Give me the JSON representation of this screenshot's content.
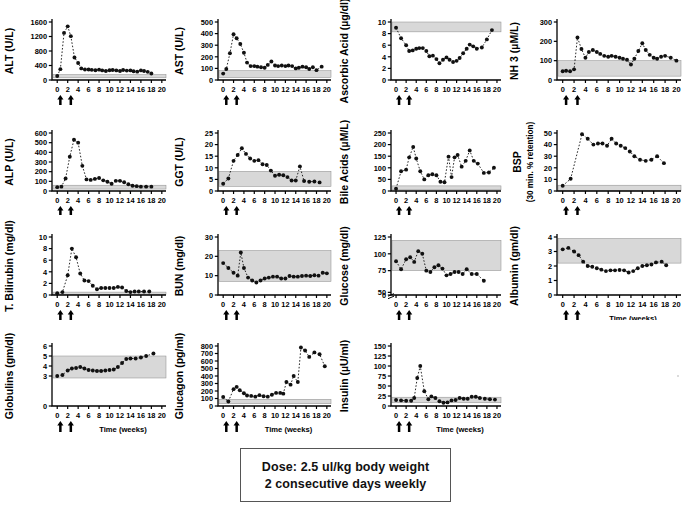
{
  "figure": {
    "xlabel": "Time  (weeks)",
    "xticks": [
      0,
      2,
      4,
      6,
      8,
      10,
      12,
      14,
      16,
      18,
      20
    ],
    "xlim": [
      -1,
      20.8
    ],
    "dose_arrows_weeks": [
      0.6,
      2.6
    ],
    "arrow_marker": "up-arrow",
    "band_color": "#d8d8d8",
    "line_color": "#111111",
    "marker": "filled-circle"
  },
  "caption": {
    "line1": "Dose: 2.5 ul/kg body weight",
    "line2": "2 consecutive days weekly"
  },
  "chart_data": [
    {
      "id": "alt",
      "type": "line",
      "ylabel": "ALT (U/L)",
      "ylim": [
        0,
        1600
      ],
      "yticks": [
        0,
        400,
        800,
        1200,
        1600
      ],
      "ref_band": [
        60,
        150
      ],
      "xlabel": "",
      "show_xlabel": false,
      "x": [
        0,
        0.6,
        1.3,
        2,
        2.6,
        3.3,
        4,
        4.6,
        5.3,
        6,
        6.6,
        7.3,
        8,
        8.6,
        9.3,
        10,
        10.6,
        11.3,
        12,
        12.6,
        13.3,
        14,
        14.6,
        15.3,
        16,
        16.6,
        17.3,
        18
      ],
      "values": [
        110,
        300,
        1300,
        1480,
        1210,
        620,
        470,
        320,
        290,
        290,
        280,
        270,
        285,
        265,
        250,
        270,
        275,
        265,
        250,
        275,
        260,
        265,
        240,
        230,
        265,
        250,
        225,
        180
      ]
    },
    {
      "id": "ast",
      "type": "line",
      "ylabel": "AST (U/L)",
      "ylim": [
        0,
        500
      ],
      "yticks": [
        0,
        100,
        200,
        300,
        400,
        500
      ],
      "ref_band": [
        20,
        80
      ],
      "xlabel": "",
      "show_xlabel": false,
      "x": [
        0,
        0.6,
        1.3,
        2,
        2.6,
        3.3,
        4,
        4.6,
        5.3,
        6,
        6.6,
        7.3,
        8,
        8.6,
        9.3,
        10,
        10.6,
        11.3,
        12,
        12.6,
        13.3,
        14,
        14.6,
        15.3,
        16,
        16.6,
        17.3,
        18,
        19
      ],
      "values": [
        55,
        95,
        230,
        395,
        360,
        310,
        235,
        150,
        120,
        120,
        115,
        110,
        105,
        130,
        160,
        125,
        120,
        125,
        120,
        125,
        120,
        100,
        105,
        115,
        110,
        95,
        110,
        85,
        115
      ]
    },
    {
      "id": "ascorbic-acid",
      "type": "line",
      "ylabel": "Ascorbic  Acid (µg/dl)",
      "ylim": [
        0,
        10
      ],
      "yticks": [
        0,
        2,
        4,
        6,
        8,
        10
      ],
      "ref_band": [
        8.3,
        10
      ],
      "xlabel": "",
      "show_xlabel": false,
      "x": [
        0,
        1,
        2,
        2.6,
        3.3,
        4,
        4.6,
        5.3,
        6,
        6.6,
        7.3,
        8,
        8.6,
        9.3,
        10,
        10.6,
        11.3,
        12,
        12.6,
        13.3,
        14,
        14.6,
        15.3,
        16,
        17,
        18,
        19
      ],
      "values": [
        9.0,
        7.2,
        6.0,
        5.0,
        5.1,
        5.4,
        5.5,
        5.5,
        5.0,
        4.1,
        4.2,
        3.6,
        2.9,
        3.5,
        3.9,
        3.5,
        3.1,
        3.3,
        3.8,
        4.6,
        5.4,
        6.1,
        5.8,
        5.4,
        5.6,
        7.0,
        8.6
      ]
    },
    {
      "id": "nh3",
      "type": "line",
      "ylabel": "NH 3  (µM/L)",
      "ylim": [
        0,
        300
      ],
      "yticks": [
        0,
        100,
        200,
        300
      ],
      "ref_band": [
        20,
        100
      ],
      "xlabel": "",
      "show_xlabel": false,
      "x": [
        0,
        0.6,
        1.3,
        2,
        2.6,
        3.3,
        4,
        4.6,
        5.3,
        6,
        6.6,
        7.3,
        8,
        8.6,
        9.3,
        10,
        10.6,
        11.3,
        12,
        12.6,
        13.3,
        14,
        14.6,
        15.3,
        16,
        16.6,
        17.3,
        18,
        19,
        20
      ],
      "values": [
        45,
        48,
        45,
        55,
        220,
        160,
        115,
        145,
        155,
        145,
        135,
        125,
        120,
        125,
        120,
        115,
        110,
        105,
        80,
        110,
        150,
        190,
        155,
        130,
        115,
        110,
        120,
        125,
        115,
        100
      ]
    },
    {
      "id": "alp",
      "type": "line",
      "ylabel": "ALP (U/L)",
      "ylim": [
        0,
        600
      ],
      "yticks": [
        0,
        100,
        200,
        300,
        400,
        500,
        600
      ],
      "ref_band": [
        20,
        60
      ],
      "xlabel": "",
      "show_xlabel": false,
      "x": [
        0,
        0.8,
        1.6,
        2.4,
        3.2,
        4,
        4.8,
        5.6,
        6.4,
        7.2,
        8,
        8.8,
        9.6,
        10.4,
        11.2,
        12,
        12.8,
        13.6,
        14.4,
        15.2,
        16,
        17,
        18
      ],
      "values": [
        40,
        45,
        130,
        355,
        530,
        500,
        260,
        120,
        115,
        125,
        135,
        110,
        95,
        75,
        105,
        105,
        90,
        70,
        55,
        50,
        45,
        45,
        45
      ]
    },
    {
      "id": "ggt",
      "type": "line",
      "ylabel": "GGT (U/L)",
      "ylim": [
        0,
        25
      ],
      "yticks": [
        0,
        5,
        10,
        15,
        20,
        25
      ],
      "ref_band": [
        2,
        8.5
      ],
      "xlabel": "",
      "show_xlabel": false,
      "x": [
        0,
        1,
        2,
        2.8,
        3.6,
        4.4,
        5.2,
        6,
        6.8,
        7.6,
        8.4,
        9.2,
        10,
        10.8,
        11.6,
        12.4,
        13.2,
        14,
        14.8,
        15.6,
        16.6,
        17.6,
        18.6
      ],
      "values": [
        3.1,
        5.4,
        13.0,
        15.5,
        18.4,
        16.0,
        14.0,
        13.0,
        13.3,
        11.5,
        11.2,
        8.8,
        6.6,
        7.0,
        6.8,
        6.0,
        4.5,
        4.5,
        10.6,
        4.3,
        4.0,
        4.1,
        3.7
      ]
    },
    {
      "id": "bile-acids",
      "type": "line",
      "ylabel": "Bile Acids (µM/L)",
      "ylim": [
        0,
        250
      ],
      "yticks": [
        0,
        50,
        100,
        150,
        200,
        250
      ],
      "ref_band": [
        5,
        22
      ],
      "xlabel": "",
      "show_xlabel": false,
      "x": [
        0,
        1,
        2,
        2.6,
        3.4,
        4,
        4.8,
        5.6,
        6.4,
        7.2,
        8,
        8.8,
        9.6,
        10.4,
        11,
        11.6,
        12.2,
        13,
        13.8,
        14.6,
        15.4,
        16.2,
        17.4,
        18.4,
        19.4
      ],
      "values": [
        10,
        85,
        92,
        145,
        190,
        140,
        85,
        50,
        68,
        72,
        68,
        40,
        38,
        148,
        60,
        145,
        155,
        105,
        130,
        175,
        130,
        118,
        78,
        80,
        100
      ]
    },
    {
      "id": "bsp",
      "type": "line",
      "ylabel": "BSP",
      "ylabel2": "(30 min. % retention)",
      "ylim": [
        0,
        50
      ],
      "yticks": [
        0,
        10,
        20,
        30,
        40,
        50
      ],
      "ref_band": [
        0,
        5
      ],
      "xlabel": "",
      "show_xlabel": false,
      "x": [
        0,
        1.4,
        3.4,
        4.4,
        5.4,
        6.2,
        7,
        7.8,
        8.6,
        9.4,
        10.2,
        11,
        11.8,
        12.6,
        13.6,
        14.6,
        15.6,
        16.6,
        17.8
      ],
      "values": [
        4.5,
        10.5,
        49,
        45,
        40,
        41,
        41,
        39,
        45,
        41,
        39,
        37,
        34,
        30,
        27,
        26,
        27,
        30,
        24
      ]
    },
    {
      "id": "t-bilirubin",
      "type": "line",
      "ylabel": "T. Bilirubin (mg/dl)",
      "ylim": [
        0,
        10
      ],
      "yticks": [
        0,
        2,
        4,
        6,
        8,
        10
      ],
      "ref_band": [
        0.05,
        0.5
      ],
      "xlabel": "",
      "show_xlabel": false,
      "x": [
        0,
        1,
        2,
        2.8,
        3.6,
        4.4,
        5.2,
        6,
        6.8,
        7.6,
        8.4,
        9.2,
        10,
        10.8,
        11.6,
        12.4,
        13.2,
        14,
        14.8,
        15.6,
        16.6,
        17.6
      ],
      "values": [
        0.3,
        0.5,
        3.4,
        8.0,
        6.5,
        3.7,
        2.5,
        2.4,
        1.6,
        1.0,
        1.2,
        1.2,
        1.2,
        1.2,
        1.4,
        1.3,
        0.7,
        0.5,
        0.6,
        0.6,
        0.6,
        0.6
      ]
    },
    {
      "id": "bun",
      "type": "line",
      "ylabel": "BUN (mg/dl)",
      "ylim": [
        0,
        30
      ],
      "yticks": [
        0,
        10,
        20,
        30
      ],
      "ref_band": [
        7,
        23
      ],
      "xlabel": "",
      "show_xlabel": false,
      "x": [
        0,
        1,
        2,
        2.8,
        3.4,
        4,
        4.8,
        5.6,
        6.4,
        7.2,
        8,
        8.8,
        9.6,
        10.4,
        11.2,
        12,
        12.8,
        13.6,
        14.4,
        15.2,
        16,
        16.8,
        17.6,
        18.4,
        19.2,
        20
      ],
      "values": [
        16.5,
        14,
        11.5,
        10,
        22,
        14,
        9,
        7.5,
        6.5,
        7.5,
        8.5,
        9,
        9.5,
        9.5,
        8.5,
        8.5,
        9.8,
        9.5,
        9.5,
        9.8,
        10,
        9.8,
        10.2,
        10,
        11.5,
        11.2
      ]
    },
    {
      "id": "glucose",
      "type": "line",
      "ylabel": "Glucose (mg/dl)",
      "ylim": [
        0,
        125
      ],
      "yticks": [
        0,
        50,
        75,
        100,
        125
      ],
      "axis_break_after": 0,
      "ref_band": [
        75,
        120
      ],
      "xlabel": "",
      "show_xlabel": false,
      "x": [
        0,
        1,
        2,
        2.8,
        3.6,
        4.4,
        5.2,
        6,
        6.8,
        7.6,
        8.4,
        9.2,
        10,
        10.8,
        11.6,
        12.4,
        13.2,
        14,
        15,
        16,
        17.4
      ],
      "values": [
        89,
        77,
        92,
        95,
        88,
        104,
        100,
        75,
        73,
        80,
        83,
        78,
        68,
        70,
        73,
        73,
        70,
        77,
        70,
        70,
        60
      ]
    },
    {
      "id": "albumin",
      "type": "line",
      "ylabel": "Albumin (gm/dl)",
      "ylim": [
        0,
        4
      ],
      "yticks": [
        0,
        1,
        2,
        3,
        4
      ],
      "ref_band": [
        2.2,
        3.9
      ],
      "xlabel": "Time  (weeks)",
      "show_xlabel": true,
      "x": [
        0,
        1,
        2,
        2.8,
        3.6,
        4.4,
        5.2,
        6,
        6.8,
        7.6,
        8.4,
        9.2,
        10,
        10.8,
        11.6,
        12.4,
        13.2,
        14,
        14.8,
        15.6,
        16.4,
        17.4,
        18.2
      ],
      "values": [
        3.15,
        3.25,
        3.0,
        2.75,
        2.3,
        2.0,
        1.95,
        1.85,
        1.75,
        1.65,
        1.7,
        1.7,
        1.72,
        1.7,
        1.55,
        1.65,
        1.85,
        2.0,
        2.05,
        2.1,
        2.25,
        2.3,
        2.05
      ]
    },
    {
      "id": "globulins",
      "type": "line",
      "ylabel": "Globulins (gm/dl)",
      "ylim": [
        0,
        6
      ],
      "yticks": [
        0,
        3,
        4,
        5,
        6
      ],
      "ref_band": [
        2.8,
        5.0
      ],
      "xlabel": "Time  (weeks)",
      "show_xlabel": true,
      "x": [
        0,
        1,
        2,
        2.8,
        3.6,
        4.4,
        5.2,
        6,
        6.8,
        7.6,
        8.4,
        9.2,
        10,
        10.8,
        11.6,
        12.4,
        13.2,
        14,
        15,
        16,
        17,
        18.4
      ],
      "values": [
        3.0,
        3.1,
        3.55,
        3.75,
        3.8,
        3.9,
        3.75,
        3.6,
        3.55,
        3.5,
        3.5,
        3.55,
        3.6,
        3.65,
        3.9,
        4.3,
        4.7,
        4.75,
        4.75,
        4.85,
        5.0,
        5.25
      ]
    },
    {
      "id": "glucagon",
      "type": "line",
      "ylabel": "Glucagon (pg/ml)",
      "ylim": [
        0,
        800
      ],
      "yticks": [
        0,
        100,
        200,
        300,
        400,
        500,
        600,
        700,
        800
      ],
      "ref_band": [
        30,
        90
      ],
      "xlabel": "Time  (weeks)",
      "show_xlabel": true,
      "x": [
        0,
        1,
        2,
        2.6,
        3.2,
        4,
        4.6,
        5.4,
        6.2,
        7,
        7.8,
        8.6,
        9.4,
        10.2,
        11,
        11.6,
        12.2,
        13,
        13.6,
        14.4,
        15,
        15.8,
        16.6,
        17.6,
        18.6,
        19.6
      ],
      "values": [
        120,
        60,
        225,
        255,
        210,
        170,
        140,
        135,
        125,
        145,
        130,
        125,
        150,
        175,
        175,
        165,
        320,
        285,
        400,
        320,
        780,
        740,
        655,
        715,
        690,
        530
      ]
    },
    {
      "id": "insulin",
      "type": "line",
      "ylabel": "Insulin (µU/ml)",
      "ylim": [
        0,
        150
      ],
      "yticks": [
        0,
        25,
        50,
        75,
        100,
        125,
        150
      ],
      "ref_band": [
        8,
        22
      ],
      "xlabel": "Time  (weeks)",
      "show_xlabel": true,
      "x": [
        0,
        1,
        2,
        3,
        3.6,
        4.2,
        4.8,
        5.6,
        6.4,
        7,
        7.8,
        8.6,
        9.4,
        10.2,
        11,
        11.8,
        12.6,
        13.4,
        14.2,
        15,
        15.8,
        16.6,
        17.6,
        18.6,
        19.6
      ],
      "values": [
        15,
        14,
        13,
        13,
        20,
        70,
        100,
        37,
        17,
        24,
        20,
        12,
        8,
        9,
        14,
        15,
        20,
        18,
        18,
        23,
        23,
        20,
        18,
        17,
        16
      ]
    }
  ]
}
